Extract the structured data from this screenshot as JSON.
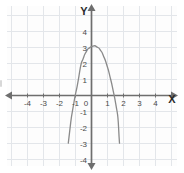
{
  "chart_data": {
    "type": "line",
    "title": "",
    "xlabel": "X",
    "ylabel": "Y",
    "xlim": [
      -4.9,
      4.9
    ],
    "ylim": [
      -4.6,
      4.4
    ],
    "grid": true,
    "legend": null,
    "x_ticks": [
      -4,
      -3,
      -2,
      -1,
      0,
      1,
      2,
      3,
      4
    ],
    "x_tick_labels": [
      "-4",
      "-3",
      "-2",
      "-1",
      "0",
      "1",
      "2",
      "3",
      "4"
    ],
    "y_ticks": [
      4,
      3,
      2,
      1,
      -1,
      -2,
      -3,
      -4
    ],
    "y_tick_labels": [
      "4",
      "3",
      "2",
      "1",
      "-1",
      "-2",
      "-3",
      "-4"
    ],
    "series": [
      {
        "name": "parabola",
        "kind": "quadratic",
        "color": "#8a8a8a",
        "vertex": [
          0.15,
          3.1
        ],
        "a": -1.75,
        "x_intercepts": [
          -1.18,
          1.48
        ],
        "y_intercept": 3.06,
        "x_domain": [
          -1.45,
          1.75
        ],
        "points": [
          [
            -1.45,
            -2.98
          ],
          [
            -1.3,
            -1.7
          ],
          [
            -1.1,
            -0.45
          ],
          [
            -0.9,
            0.56
          ],
          [
            -0.7,
            1.72
          ],
          [
            -0.5,
            2.36
          ],
          [
            -0.3,
            2.79
          ],
          [
            -0.1,
            3.0
          ],
          [
            0.15,
            3.1
          ],
          [
            0.4,
            3.0
          ],
          [
            0.6,
            2.77
          ],
          [
            0.8,
            2.35
          ],
          [
            1.0,
            1.77
          ],
          [
            1.2,
            1.0
          ],
          [
            1.4,
            0.08
          ],
          [
            1.6,
            -1.0
          ],
          [
            1.75,
            -2.98
          ]
        ]
      }
    ],
    "axis_arrows": {
      "x_left": true,
      "x_right": true,
      "y_up": true,
      "y_down": true
    },
    "colors": {
      "curve": "#8a8a8a",
      "axis": "#6e6e6e",
      "grid": "#e3e6ea",
      "tick_text": "#4a4a4a",
      "axis_label": "#2b2b2b",
      "background": "#ffffff",
      "plot_background": "#fdfdfd"
    }
  },
  "labels": {
    "x_axis_label": "X",
    "y_axis_label": "Y"
  }
}
